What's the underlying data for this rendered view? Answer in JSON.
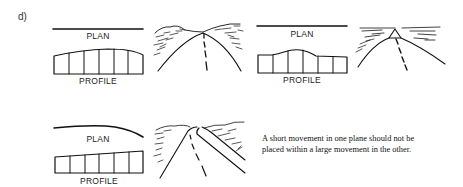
{
  "figure": {
    "panel_label": "d)",
    "examples": [
      {
        "id": "example-1",
        "plan_label": "PLAN",
        "profile_label": "PROFILE",
        "plan": "straight",
        "profile": "long crest"
      },
      {
        "id": "example-2",
        "plan_label": "PLAN",
        "profile_label": "PROFILE",
        "plan": "straight",
        "profile": "short crest"
      },
      {
        "id": "example-3",
        "plan_label": "PLAN",
        "profile_label": "PROFILE",
        "plan": "curve at end",
        "profile": "constant grade"
      }
    ],
    "caption": {
      "line1": "A short movement in one plane should not be",
      "line2": "placed within a large movement in the other."
    },
    "colors": {
      "ink": "#111111",
      "background": "#ffffff"
    }
  }
}
